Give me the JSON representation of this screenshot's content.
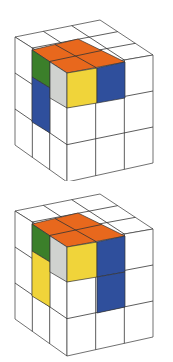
{
  "figures": [
    {
      "name": "cube-1",
      "offset_y": 0,
      "pieces": {
        "top": "#e8681d",
        "left_upper": "#3b7f2a",
        "left_lower": "#2f4f9c",
        "inner_side": "#d0d2cf",
        "front_yellow": "#f0d43a",
        "right_upper": "#2f4f9c",
        "right_lower": "none"
      }
    },
    {
      "name": "cube-2",
      "offset_y": 174,
      "pieces": {
        "top": "#e8681d",
        "left_upper": "#3b7f2a",
        "left_lower": "#f0d43a",
        "inner_side": "#d0d2cf",
        "front_yellow": "#f0d43a",
        "right_upper": "#2f4f9c",
        "right_lower": "#2f4f9c"
      }
    }
  ],
  "colors": {
    "outline": "#333333",
    "background": "#ffffff"
  }
}
